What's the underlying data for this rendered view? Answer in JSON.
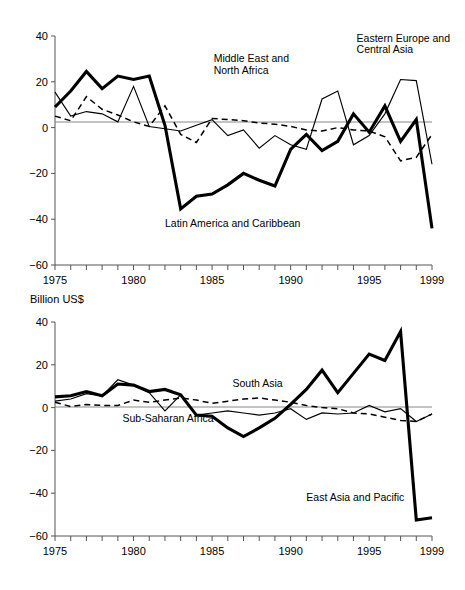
{
  "figure": {
    "axis_title": "Billion US$",
    "background_color": "#ffffff",
    "line_color": "#000000"
  },
  "chart_data": [
    {
      "type": "line",
      "id": "top-panel",
      "title": "",
      "xlabel": "",
      "ylabel": "",
      "ylim": [
        -60,
        40
      ],
      "xlim": [
        1975,
        1999
      ],
      "grid": false,
      "legend_position": "inline-annotations",
      "yticks": [
        40,
        20,
        0,
        -20,
        -40,
        -60
      ],
      "ytick_labels": [
        "40",
        "20",
        "0",
        "−20",
        "−40",
        "−60"
      ],
      "xticks": [
        1975,
        1980,
        1985,
        1990,
        1995,
        1999
      ],
      "xtick_labels": [
        "1975",
        "1980",
        "1985",
        "1990",
        "1995",
        "1999"
      ],
      "x": [
        1975,
        1976,
        1977,
        1978,
        1979,
        1980,
        1981,
        1982,
        1983,
        1984,
        1985,
        1986,
        1987,
        1988,
        1989,
        1990,
        1991,
        1992,
        1993,
        1994,
        1995,
        1996,
        1997,
        1998,
        1999
      ],
      "series": [
        {
          "name": "Latin America and Caribbean",
          "style": "bold-solid",
          "values": [
            9,
            16,
            24.5,
            17,
            22.5,
            21,
            22.5,
            1,
            -35.5,
            -30,
            -29,
            -25,
            -20,
            -23,
            -25.5,
            -9.5,
            -3,
            -10,
            -6,
            6,
            -2,
            9.5,
            -6,
            3.5,
            -44
          ]
        },
        {
          "name": "Middle East and North Africa",
          "style": "dashed",
          "values": [
            5,
            3,
            13.5,
            8,
            5.5,
            2.5,
            0.5,
            9.5,
            -3,
            -6.5,
            4,
            3.5,
            3,
            2,
            1.5,
            0.5,
            -1,
            -1.5,
            0,
            -1,
            -1.5,
            -4,
            -14.5,
            -13,
            -3
          ]
        },
        {
          "name": "Eastern Europe and Central Asia",
          "style": "thin-solid",
          "values": [
            15.5,
            5,
            7,
            6,
            2.5,
            18,
            0.5,
            -0.5,
            -1.5,
            1,
            3.5,
            -3.5,
            -1,
            -9,
            -3.5,
            -7.5,
            -9.5,
            12.5,
            16,
            -7.5,
            -3.5,
            6,
            21,
            20.5,
            -16
          ]
        }
      ],
      "annotations": [
        {
          "text": "Eastern Europe and",
          "x": 1994.2,
          "y": 37.5
        },
        {
          "text": "Central Asia",
          "x": 1994.2,
          "y": 32.5
        },
        {
          "text": "Middle East and",
          "x": 1985.1,
          "y": 28.5
        },
        {
          "text": "North Africa",
          "x": 1985.1,
          "y": 23.5
        },
        {
          "text": "Latin America and Caribbean",
          "x": 1982.0,
          "y": -43.5
        }
      ]
    },
    {
      "type": "line",
      "id": "bottom-panel",
      "title": "Billion US$",
      "xlabel": "",
      "ylabel": "",
      "ylim": [
        -60,
        40
      ],
      "xlim": [
        1975,
        1999
      ],
      "grid": false,
      "legend_position": "inline-annotations",
      "yticks": [
        40,
        20,
        0,
        -20,
        -40,
        -60
      ],
      "ytick_labels": [
        "40",
        "20",
        "0",
        "−20",
        "−40",
        "−60"
      ],
      "xticks": [
        1975,
        1980,
        1985,
        1990,
        1995,
        1999
      ],
      "xtick_labels": [
        "1975",
        "1980",
        "1985",
        "1990",
        "1995",
        "1999"
      ],
      "x": [
        1975,
        1976,
        1977,
        1978,
        1979,
        1980,
        1981,
        1982,
        1983,
        1984,
        1985,
        1986,
        1987,
        1988,
        1989,
        1990,
        1991,
        1992,
        1993,
        1994,
        1995,
        1996,
        1997,
        1998,
        1999
      ],
      "series": [
        {
          "name": "East Asia and Pacific",
          "style": "bold-solid",
          "values": [
            5,
            5.5,
            7.5,
            5.5,
            11,
            10.5,
            7.5,
            8.5,
            6,
            -3.5,
            -4,
            -9.5,
            -13.5,
            -9.5,
            -5,
            1.5,
            8.5,
            17.5,
            7,
            16,
            25,
            22,
            35.5,
            -52.5,
            -51.5
          ]
        },
        {
          "name": "South Asia",
          "style": "dashed",
          "values": [
            2.5,
            0.5,
            1.5,
            1,
            1,
            3.5,
            2.5,
            3.5,
            4.5,
            3.5,
            2,
            3,
            4,
            4.5,
            3.5,
            2.5,
            1,
            0,
            -0.5,
            -2.5,
            -3,
            -4.5,
            -6,
            -6.5,
            -3
          ]
        },
        {
          "name": "Sub-Saharan Africa",
          "style": "thin-solid",
          "values": [
            3,
            4,
            6.5,
            5.5,
            13,
            10.5,
            7,
            -1.5,
            6,
            -3.5,
            -2.5,
            -1.5,
            -2.5,
            -3.5,
            -2.5,
            -0.5,
            -5.5,
            -2.5,
            -3,
            -2.5,
            1,
            -2,
            -0.5,
            -6.5,
            -3
          ]
        }
      ],
      "annotations": [
        {
          "text": "South Asia",
          "x": 1986.3,
          "y": 9.5
        },
        {
          "text": "Sub-Saharan Africa",
          "x": 1979.3,
          "y": -6.5
        },
        {
          "text": "East Asia and Pacific",
          "x": 1991.0,
          "y": -43.5
        }
      ]
    }
  ]
}
